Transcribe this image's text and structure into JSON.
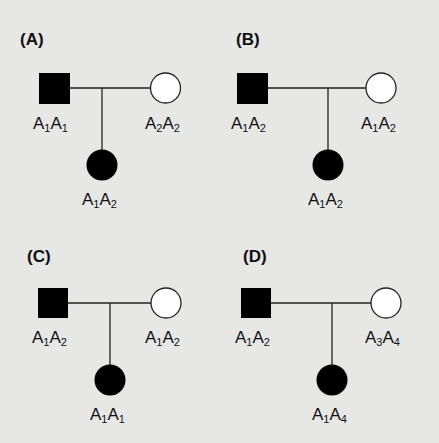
{
  "figure": {
    "type": "pedigree",
    "panels": [
      {
        "label": "(A)",
        "father": {
          "sex": "male",
          "affected": true,
          "genotype": {
            "a1": "A",
            "s1": "1",
            "a2": "A",
            "s2": "1"
          }
        },
        "mother": {
          "sex": "female",
          "affected": false,
          "genotype": {
            "a1": "A",
            "s1": "2",
            "a2": "A",
            "s2": "2"
          }
        },
        "child": {
          "sex": "female",
          "affected": true,
          "genotype": {
            "a1": "A",
            "s1": "1",
            "a2": "A",
            "s2": "2"
          }
        }
      },
      {
        "label": "(B)",
        "father": {
          "sex": "male",
          "affected": true,
          "genotype": {
            "a1": "A",
            "s1": "1",
            "a2": "A",
            "s2": "2"
          }
        },
        "mother": {
          "sex": "female",
          "affected": false,
          "genotype": {
            "a1": "A",
            "s1": "1",
            "a2": "A",
            "s2": "2"
          }
        },
        "child": {
          "sex": "female",
          "affected": true,
          "genotype": {
            "a1": "A",
            "s1": "1",
            "a2": "A",
            "s2": "2"
          }
        }
      },
      {
        "label": "(C)",
        "father": {
          "sex": "male",
          "affected": true,
          "genotype": {
            "a1": "A",
            "s1": "1",
            "a2": "A",
            "s2": "2"
          }
        },
        "mother": {
          "sex": "female",
          "affected": false,
          "genotype": {
            "a1": "A",
            "s1": "1",
            "a2": "A",
            "s2": "2"
          }
        },
        "child": {
          "sex": "female",
          "affected": true,
          "genotype": {
            "a1": "A",
            "s1": "1",
            "a2": "A",
            "s2": "1"
          }
        }
      },
      {
        "label": "(D)",
        "father": {
          "sex": "male",
          "affected": true,
          "genotype": {
            "a1": "A",
            "s1": "1",
            "a2": "A",
            "s2": "2"
          }
        },
        "mother": {
          "sex": "female",
          "affected": false,
          "genotype": {
            "a1": "A",
            "s1": "3",
            "a2": "A",
            "s2": "4"
          }
        },
        "child": {
          "sex": "female",
          "affected": true,
          "genotype": {
            "a1": "A",
            "s1": "1",
            "a2": "A",
            "s2": "4"
          }
        }
      }
    ]
  },
  "colors": {
    "background": "#e7e7e6",
    "affected": "#000000",
    "unaffected": "#ffffff",
    "line": "#222222"
  }
}
